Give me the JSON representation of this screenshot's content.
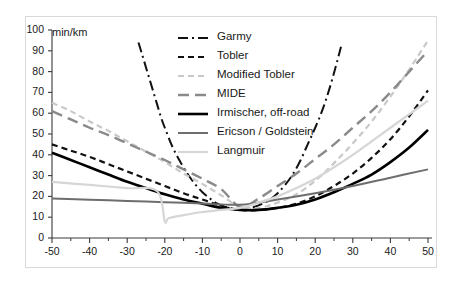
{
  "chart_data": {
    "type": "line",
    "title": "",
    "subtitle": "",
    "xlabel": "",
    "ylabel": "min/km",
    "y_unit_label": "min/km",
    "xlim": [
      -50,
      50
    ],
    "ylim": [
      0,
      100
    ],
    "x_ticks": [
      -50,
      -40,
      -30,
      -20,
      -10,
      0,
      10,
      20,
      30,
      40,
      50
    ],
    "x_tick_labels": [
      "-50",
      "-40",
      "-30",
      "-20",
      "-10",
      "0",
      "10",
      "20",
      "30",
      "40",
      "50"
    ],
    "x_minor_tick_step": 5,
    "y_ticks": [
      0,
      10,
      20,
      30,
      40,
      50,
      60,
      70,
      80,
      90,
      100
    ],
    "y_tick_labels": [
      "0",
      "10",
      "20",
      "30",
      "40",
      "50",
      "60",
      "70",
      "80",
      "90",
      "100"
    ],
    "grid": false,
    "legend_position": "upper-center",
    "series": [
      {
        "name": "Garmy",
        "color": "#111111",
        "style": "dash-dot",
        "width": 2.0,
        "x": [
          -27,
          -26,
          -25,
          -24,
          -23,
          -22,
          -21,
          -20,
          -18,
          -16,
          -14,
          -12,
          -10,
          -8,
          -6,
          -4,
          -2,
          0,
          2,
          4,
          6,
          8,
          10,
          12,
          14,
          16,
          18,
          20,
          22,
          24,
          26,
          27
        ],
        "y": [
          94,
          88,
          82,
          76,
          70,
          64,
          58,
          53,
          44,
          37,
          31,
          26,
          22,
          19,
          16.5,
          15,
          14,
          13.5,
          14,
          15,
          16.5,
          18.5,
          21.5,
          25.5,
          30.5,
          37,
          45,
          53,
          62,
          73,
          86,
          93
        ]
      },
      {
        "name": "Tobler",
        "color": "#111111",
        "style": "dashed",
        "width": 2.2,
        "x": [
          -50,
          -45,
          -40,
          -35,
          -30,
          -25,
          -20,
          -15,
          -10,
          -5,
          0,
          5,
          10,
          15,
          20,
          25,
          30,
          35,
          40,
          45,
          50
        ],
        "y": [
          45,
          42,
          39,
          35.5,
          32,
          28.5,
          25,
          21.5,
          18.5,
          15.5,
          13.5,
          13.5,
          14.5,
          16.5,
          20,
          25,
          31,
          38.5,
          47.5,
          58.5,
          71
        ]
      },
      {
        "name": "Modified Tobler",
        "color": "#c9c9c9",
        "style": "dashed",
        "width": 2.2,
        "x": [
          -50,
          -45,
          -40,
          -35,
          -30,
          -25,
          -20,
          -15,
          -10,
          -5,
          0,
          5,
          10,
          15,
          20,
          25,
          30,
          35,
          40,
          45,
          50
        ],
        "y": [
          65,
          61,
          56,
          51.5,
          46.5,
          41.5,
          36.5,
          31,
          26,
          20.5,
          15,
          14.5,
          17,
          21,
          27.5,
          36,
          45.5,
          56,
          68,
          81,
          95
        ]
      },
      {
        "name": "MIDE",
        "color": "#8a8a8a",
        "style": "long-dash",
        "width": 2.4,
        "x": [
          -50,
          -45,
          -40,
          -35,
          -30,
          -25,
          -20,
          -15,
          -10,
          -5,
          0,
          5,
          10,
          15,
          20,
          25,
          30,
          35,
          40,
          45,
          50
        ],
        "y": [
          61,
          57,
          53,
          49.5,
          45.5,
          41.5,
          37.5,
          33,
          28.5,
          23.5,
          15,
          19,
          25,
          31,
          38,
          45,
          53,
          61,
          70,
          80,
          90
        ]
      },
      {
        "name": "Irmischer, off-road",
        "color": "#000000",
        "style": "solid",
        "width": 2.6,
        "x": [
          -50,
          -45,
          -40,
          -35,
          -30,
          -25,
          -20,
          -15,
          -10,
          -5,
          0,
          5,
          10,
          15,
          20,
          25,
          30,
          35,
          40,
          45,
          50
        ],
        "y": [
          41,
          37.5,
          34,
          30.5,
          27,
          24,
          21,
          18.5,
          16.5,
          14.5,
          13.5,
          13.5,
          14.5,
          16,
          18.5,
          22,
          26,
          30.5,
          36.5,
          43.5,
          52
        ]
      },
      {
        "name": "Ericson / Goldstein",
        "color": "#6e6e6e",
        "style": "solid",
        "width": 2.0,
        "x": [
          -50,
          -40,
          -30,
          -20,
          -10,
          0,
          10,
          20,
          30,
          40,
          50
        ],
        "y": [
          19,
          18.4,
          17.8,
          17.2,
          16.6,
          16,
          18.5,
          21.5,
          25,
          29,
          33
        ]
      },
      {
        "name": "Langmuir",
        "color": "#d6d6d6",
        "style": "solid",
        "width": 2.2,
        "x": [
          -50,
          -40,
          -30,
          -22,
          -20,
          -19,
          -15,
          -10,
          -5,
          0,
          5,
          10,
          15,
          20,
          25,
          30,
          35,
          40,
          45,
          50
        ],
        "y": [
          27,
          25.5,
          24,
          22.5,
          8,
          9.5,
          11,
          12.5,
          13.5,
          14.5,
          17,
          20,
          24,
          28.5,
          34,
          40,
          46.5,
          53,
          59.5,
          66
        ]
      }
    ]
  },
  "legend": {
    "items": [
      {
        "label": "Garmy",
        "icon": "dash-dot-line-icon"
      },
      {
        "label": "Tobler",
        "icon": "dashed-line-icon"
      },
      {
        "label": "Modified Tobler",
        "icon": "dashed-light-line-icon"
      },
      {
        "label": "MIDE",
        "icon": "long-dash-line-icon"
      },
      {
        "label": "Irmischer, off-road",
        "icon": "solid-black-line-icon"
      },
      {
        "label": "Ericson / Goldstein",
        "icon": "solid-gray-line-icon"
      },
      {
        "label": "Langmuir",
        "icon": "solid-light-line-icon"
      }
    ]
  },
  "axes": {
    "y_unit": "min/km"
  }
}
